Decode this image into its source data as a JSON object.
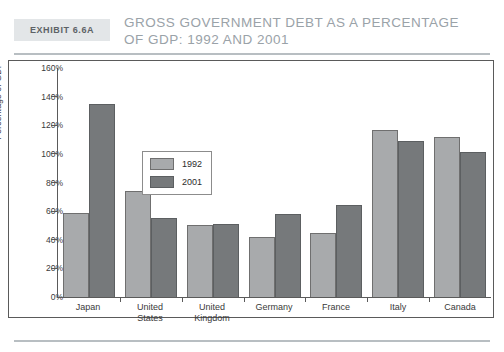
{
  "header": {
    "exhibit_tag": "Exhibit 6.6A",
    "title": "Gross Government Debt as a Percentage\nof GDP: 1992 and 2001"
  },
  "chart_data": {
    "type": "bar",
    "title": "Gross Government Debt as a Percentage of GDP: 1992 and 2001",
    "xlabel": "",
    "ylabel": "Percentage of GDP",
    "ylim": [
      0,
      160
    ],
    "ytick_step": 20,
    "ytick_labels": [
      "160%",
      "140%",
      "120%",
      "100%",
      "80%",
      "60%",
      "40%",
      "20%",
      "0%"
    ],
    "ytick_values": [
      160,
      140,
      120,
      100,
      80,
      60,
      40,
      20,
      0
    ],
    "grid": false,
    "legend_position": "inside-upper-left",
    "categories": [
      "Japan",
      "United\nStates",
      "United\nKingdom",
      "Germany",
      "France",
      "Italy",
      "Canada"
    ],
    "category_names": [
      "Japan",
      "United States",
      "United Kingdom",
      "Germany",
      "France",
      "Italy",
      "Canada"
    ],
    "series": [
      {
        "name": "1992",
        "color": "#a8aaac",
        "values": [
          59,
          74,
          50,
          42,
          45,
          117,
          112
        ]
      },
      {
        "name": "2001",
        "color": "#76797b",
        "values": [
          135,
          55,
          51,
          58,
          64,
          109,
          101
        ]
      }
    ]
  },
  "colors": {
    "series_1992": "#a8aaac",
    "series_2001": "#76797b",
    "axis": "#5a5a5a",
    "header_rule": "#b8bec2",
    "title_text": "#9aa2a8",
    "tag_background": "#e3e6e8"
  }
}
